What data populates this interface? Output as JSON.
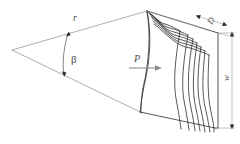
{
  "figure": {
    "type": "engineering-line-diagram",
    "background_color": "#ffffff",
    "line_color": "#3a3a3a",
    "thin_line_color": "#8a8a8a"
  },
  "labels": {
    "radius": "r",
    "angle": "β",
    "load": "P",
    "depth": "D",
    "width": "w"
  },
  "annotations": {
    "radius_desc": "slant length of wedge flank",
    "angle_desc": "included wedge half-angle indicator arc",
    "load_desc": "applied load arrow pointing right",
    "depth_desc": "block depth dimension along top-right edge",
    "width_desc": "block height dimension along right edge"
  },
  "geometry": {
    "apex": [
      12,
      50
    ],
    "top_corner": [
      147,
      11
    ],
    "bottom_corner": [
      140,
      112
    ],
    "block_top_right": [
      218,
      33
    ],
    "block_bottom_right": [
      215,
      128
    ],
    "flow_line_count": 7
  }
}
